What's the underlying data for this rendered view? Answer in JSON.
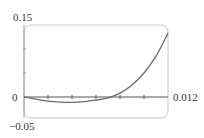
{
  "chart_data": {
    "type": "line",
    "title": "",
    "xlabel": "",
    "ylabel": "",
    "xlim": [
      0,
      0.012
    ],
    "ylim": [
      -0.05,
      0.15
    ],
    "grid": false,
    "legend": null,
    "x_tick_step": 0.002,
    "y_tick_step": 0.05,
    "labels": {
      "y_max": "0.15",
      "y_min": "−0.05",
      "origin": "0",
      "x_max": "0.012"
    },
    "series": [
      {
        "name": "f(x)",
        "color": "#6b6b6b",
        "x": [
          0,
          0.001,
          0.002,
          0.003,
          0.004,
          0.005,
          0.006,
          0.007,
          0.008,
          0.009,
          0.01,
          0.011,
          0.012
        ],
        "y": [
          0,
          -0.0045,
          -0.0085,
          -0.0105,
          -0.011,
          -0.0095,
          -0.0065,
          -0.002,
          0.008,
          0.025,
          0.05,
          0.085,
          0.133
        ]
      }
    ]
  },
  "colors": {
    "frame": "#c8c8c8",
    "axis": "#555555",
    "curve": "#6b6b6b"
  }
}
